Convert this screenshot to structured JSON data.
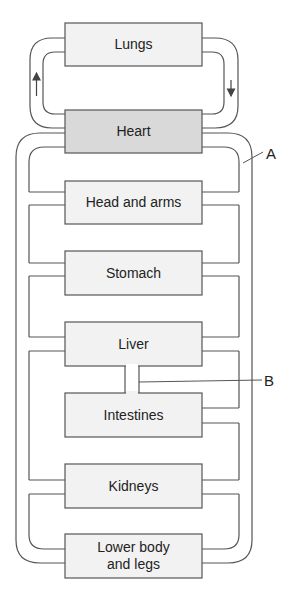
{
  "diagram": {
    "title": "",
    "organs": [
      {
        "id": "lungs",
        "label": "Lungs"
      },
      {
        "id": "heart",
        "label": "Heart"
      },
      {
        "id": "head_arms",
        "label": "Head and arms"
      },
      {
        "id": "stomach",
        "label": "Stomach"
      },
      {
        "id": "liver",
        "label": "Liver"
      },
      {
        "id": "intestines",
        "label": "Intestines"
      },
      {
        "id": "kidneys",
        "label": "Kidneys"
      },
      {
        "id": "lower_body_line1",
        "label": "Lower body"
      },
      {
        "id": "lower_body_line2",
        "label": "and legs"
      }
    ],
    "callouts": {
      "a": "A",
      "b": "B"
    },
    "arrows": {
      "left": "up-arrow-icon",
      "right": "down-arrow-icon"
    },
    "colors": {
      "organ_fill": "#f2f2f2",
      "heart_fill": "#d9d9d9",
      "stroke": "#555555"
    }
  }
}
